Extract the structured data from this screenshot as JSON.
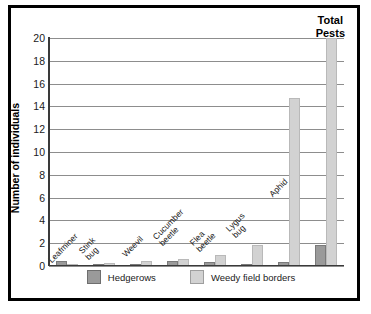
{
  "chart_data": {
    "type": "bar",
    "title": "Total Pests",
    "xlabel": "",
    "ylabel": "Number of individuals",
    "ylim": [
      0,
      20
    ],
    "ytick_step": 2,
    "yticks": [
      "0",
      "2",
      "4",
      "6",
      "8",
      "10",
      "12",
      "14",
      "16",
      "18",
      "20"
    ],
    "grid": true,
    "legend_position": "bottom",
    "categories": [
      "Leafminer",
      "Stink bug",
      "Weevil",
      "Cucumber beetle",
      "Flea beetle",
      "Lygus bug",
      "Aphid",
      "Total Pests"
    ],
    "series": [
      {
        "name": "Hedgerows",
        "color": "#9a9a9a",
        "values": [
          0.45,
          0.08,
          0.1,
          0.45,
          0.35,
          0.2,
          0.35,
          1.8
        ]
      },
      {
        "name": "Weedy field borders",
        "color": "#d2d2d2",
        "values": [
          0.12,
          0.3,
          0.45,
          0.65,
          0.95,
          1.8,
          14.7,
          20.0
        ]
      }
    ]
  },
  "legend": {
    "items": [
      {
        "label": "Hedgerows"
      },
      {
        "label": "Weedy field borders"
      }
    ]
  },
  "annotations": {
    "total_pests_line1": "Total",
    "total_pests_line2": "Pests"
  }
}
